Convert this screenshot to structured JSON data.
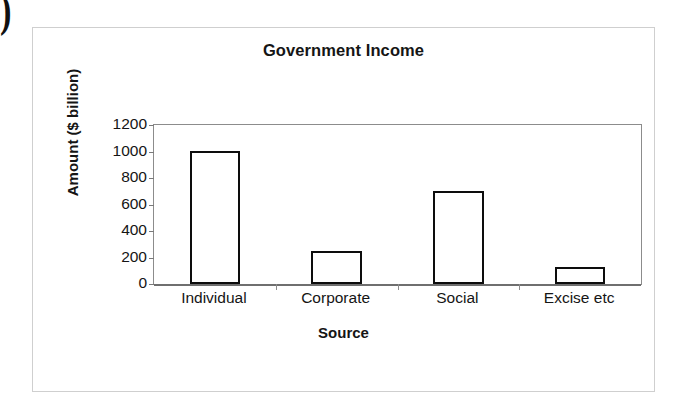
{
  "decoration": {
    "stray_glyph": ")"
  },
  "chart_data": {
    "type": "bar",
    "title": "Government Income",
    "xlabel": "Source",
    "ylabel": "Amount ($ billion)",
    "categories": [
      "Individual",
      "Corporate",
      "Social",
      "Excise etc"
    ],
    "values": [
      1005,
      250,
      700,
      128
    ],
    "ylim": [
      0,
      1200
    ],
    "ytick_labels": [
      "1200",
      "1000",
      "800",
      "600",
      "400",
      "200",
      "0"
    ],
    "ytick_values": [
      1200,
      1000,
      800,
      600,
      400,
      200,
      0
    ],
    "grid": false,
    "legend": false,
    "bar_fill_color": "#ffffff",
    "bar_edge_color": "#0d0d0d",
    "plot_border_color": "#8c8c8c",
    "frame_border_color": "#cfcfcf",
    "background_color": "#ffffff",
    "text_color": "#151515"
  }
}
